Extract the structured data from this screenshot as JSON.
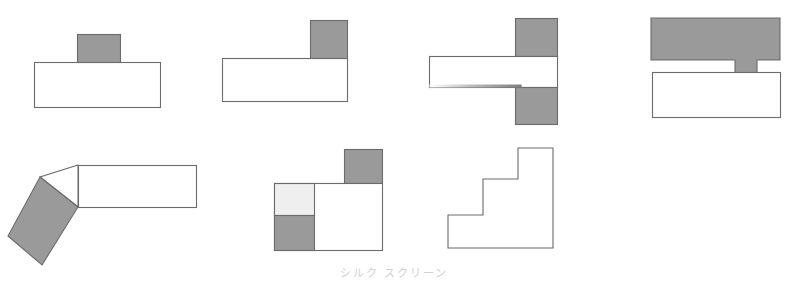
{
  "sheet": {
    "width": 788,
    "height": 281,
    "background": "#ffffff",
    "caption_text": "シルク スクリーン"
  },
  "palette": {
    "outline": "#6b6b6b",
    "fill_white": "#ffffff",
    "fill_gray": "#9a9a9a",
    "fill_light_gray": "#efefef",
    "caption_gray": "#d0d0d0"
  },
  "figures": [
    {
      "name": "tee-block-centered",
      "label": "Figure 1 - centered boss on plate",
      "parts": [
        {
          "name": "base-plate",
          "shape": "rect",
          "fill": "fill_white",
          "x": 34,
          "y": 62,
          "w": 126,
          "h": 45
        },
        {
          "name": "center-boss",
          "shape": "rect",
          "fill": "fill_gray",
          "x": 77,
          "y": 34,
          "w": 43,
          "h": 28
        }
      ]
    },
    {
      "name": "ell-block-corner",
      "label": "Figure 2 - corner boss on plate",
      "parts": [
        {
          "name": "base-plate",
          "shape": "rect",
          "fill": "fill_white",
          "x": 222,
          "y": 58,
          "w": 125,
          "h": 43
        },
        {
          "name": "corner-boss",
          "shape": "rect",
          "fill": "fill_gray",
          "x": 310,
          "y": 20,
          "w": 37,
          "h": 38
        }
      ]
    },
    {
      "name": "cross-bar-double-boss",
      "label": "Figure 3 - bar with upper and lower bosses",
      "parts": [
        {
          "name": "upper-boss",
          "shape": "rect",
          "fill": "fill_gray",
          "x": 515,
          "y": 18,
          "w": 42,
          "h": 38
        },
        {
          "name": "horizontal-bar",
          "shape": "rect",
          "fill": "fill_white",
          "x": 429,
          "y": 56,
          "w": 128,
          "h": 31
        },
        {
          "name": "lower-boss",
          "shape": "rect",
          "fill": "fill_gray",
          "x": 515,
          "y": 87,
          "w": 42,
          "h": 37
        }
      ]
    },
    {
      "name": "tabbed-bar-over-plate",
      "label": "Figure 4 - tabbed gray bar above plate",
      "parts": [
        {
          "name": "tabbed-bar",
          "shape": "path",
          "fill": "fill_gray",
          "points": "651,18 780,18 780,60 757,60 757,73 735,73 735,60 651,60"
        },
        {
          "name": "base-plate",
          "shape": "rect",
          "fill": "fill_white",
          "x": 652,
          "y": 72,
          "w": 128,
          "h": 45
        }
      ]
    },
    {
      "name": "bent-bar-angled-block",
      "label": "Figure 5 - straight bar with angled gray block",
      "parts": [
        {
          "name": "straight-bar",
          "shape": "rect",
          "fill": "fill_white",
          "x": 78,
          "y": 165,
          "w": 118,
          "h": 42
        },
        {
          "name": "elbow-wedge",
          "shape": "path",
          "fill": "fill_white",
          "points": "78,165 78,207 40,177"
        },
        {
          "name": "angled-block",
          "shape": "path",
          "fill": "fill_gray",
          "points": "40,177 78,207 42,265 8,236"
        }
      ]
    },
    {
      "name": "quadrant-square-with-boss",
      "label": "Figure 6 - square with split left column and corner boss",
      "parts": [
        {
          "name": "corner-boss",
          "shape": "rect",
          "fill": "fill_gray",
          "x": 344,
          "y": 149,
          "w": 38,
          "h": 34
        },
        {
          "name": "main-body",
          "shape": "rect",
          "fill": "fill_white",
          "x": 274,
          "y": 183,
          "w": 108,
          "h": 67
        },
        {
          "name": "left-upper-cell",
          "shape": "rect",
          "fill": "fill_light_gray",
          "x": 274,
          "y": 183,
          "w": 40,
          "h": 32
        },
        {
          "name": "left-lower-cell",
          "shape": "rect",
          "fill": "fill_gray",
          "x": 274,
          "y": 215,
          "w": 40,
          "h": 35
        }
      ]
    },
    {
      "name": "staircase-profile",
      "label": "Figure 7 - three step staircase outline",
      "parts": [
        {
          "name": "staircase-outline",
          "shape": "path",
          "fill": "fill_white",
          "points": "448,215 483,215 483,179 518,179 518,148 553,148 553,248 448,248"
        }
      ]
    }
  ]
}
